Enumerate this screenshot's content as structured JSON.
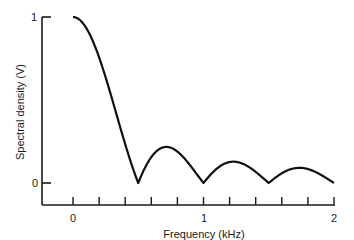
{
  "chart_data": {
    "type": "line",
    "title": "",
    "xlabel": "Frequency (kHz)",
    "ylabel": "Spectral density (V)",
    "xlim": [
      -0.24,
      2.0
    ],
    "ylim": [
      0,
      1
    ],
    "x_ticks": [
      0,
      0.2,
      0.4,
      0.6,
      0.8,
      1.0,
      1.2,
      1.4,
      1.6,
      1.8,
      2.0
    ],
    "x_tick_labels": [
      {
        "value": 0,
        "label": "0"
      },
      {
        "value": 1,
        "label": "1"
      },
      {
        "value": 2,
        "label": "2"
      }
    ],
    "y_tick_labels": [
      {
        "value": 0,
        "label": "0"
      },
      {
        "value": 1,
        "label": "1"
      }
    ],
    "grid": false,
    "legend": null,
    "series": [
      {
        "name": "Spectral density",
        "x": [
          0,
          0.05,
          0.1,
          0.15,
          0.2,
          0.25,
          0.3,
          0.35,
          0.4,
          0.45,
          0.5,
          0.55,
          0.6,
          0.65,
          0.7,
          0.75,
          0.8,
          0.85,
          0.9,
          0.95,
          1.0,
          1.05,
          1.1,
          1.15,
          1.2,
          1.25,
          1.3,
          1.35,
          1.4,
          1.45,
          1.5,
          1.55,
          1.6,
          1.65,
          1.7,
          1.75,
          1.8,
          1.85,
          1.9,
          1.95,
          2.0
        ],
        "values": [
          1.0,
          0.98,
          0.94,
          0.86,
          0.76,
          0.64,
          0.5,
          0.37,
          0.23,
          0.11,
          0.0,
          0.09,
          0.16,
          0.2,
          0.21,
          0.21,
          0.19,
          0.15,
          0.11,
          0.05,
          0.0,
          0.06,
          0.1,
          0.13,
          0.14,
          0.13,
          0.12,
          0.1,
          0.07,
          0.04,
          0.0,
          0.04,
          0.07,
          0.09,
          0.1,
          0.1,
          0.09,
          0.08,
          0.06,
          0.04,
          0.02
        ]
      }
    ]
  },
  "plot": {
    "y_axis_label": "Spectral density (V)",
    "x_axis_label": "Frequency (kHz)",
    "y_label_top": "1",
    "y_label_bottom": "0",
    "x_label_0": "0",
    "x_label_1": "1",
    "x_label_2": "2",
    "line_color": "#111111"
  }
}
